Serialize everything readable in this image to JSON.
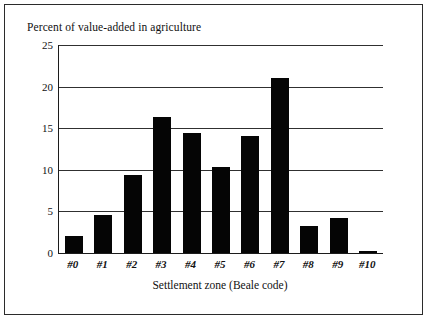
{
  "chart_data": {
    "type": "bar",
    "title": "Percent of value-added in agriculture",
    "xlabel": "Settlement zone (Beale code)",
    "ylabel": "",
    "categories": [
      "#0",
      "#1",
      "#2",
      "#3",
      "#4",
      "#5",
      "#6",
      "#7",
      "#8",
      "#9",
      "#10"
    ],
    "values": [
      2.0,
      4.6,
      9.4,
      16.4,
      14.4,
      10.3,
      14.1,
      21.0,
      3.3,
      4.2,
      0.3
    ],
    "ylim": [
      0,
      25
    ],
    "yticks": [
      0,
      5,
      10,
      15,
      20,
      25
    ],
    "ytick_labels": [
      "0",
      "5",
      "10",
      "15",
      "20",
      "25"
    ],
    "grid": true,
    "grid_axis": "y",
    "legend": false,
    "bar_color": "#050505",
    "axis_color": "#1c1c1c",
    "background": "#ffffff"
  },
  "frame": {
    "border_color": "#2b2b2b"
  }
}
